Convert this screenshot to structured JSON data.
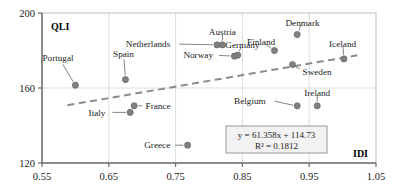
{
  "chart_data": {
    "type": "scatter",
    "title": "",
    "xlabel": "IDI",
    "ylabel": "QLI",
    "xlim": [
      0.55,
      1.05
    ],
    "ylim": [
      120,
      200
    ],
    "xticks": [
      "0.55",
      "0.65",
      "0.75",
      "0.85",
      "0.95",
      "1.05"
    ],
    "xtick_values": [
      0.55,
      0.65,
      0.75,
      0.85,
      0.95,
      1.05
    ],
    "yticks": [
      "120",
      "160",
      "200"
    ],
    "ytick_values": [
      120,
      160,
      200
    ],
    "grid": true,
    "legend": "none",
    "marker_color": "#808080",
    "trendline_color": "#8c8c8c",
    "points": [
      {
        "label": "Portugal",
        "x": 0.6,
        "y": 161.5,
        "lx": 0.574,
        "ly": 176.0,
        "anchor": "middle"
      },
      {
        "label": "Spain",
        "x": 0.675,
        "y": 164.5,
        "lx": 0.672,
        "ly": 178.5,
        "anchor": "middle"
      },
      {
        "label": "Italy",
        "x": 0.682,
        "y": 147.0,
        "lx": 0.645,
        "ly": 147.0,
        "anchor": "end"
      },
      {
        "label": "France",
        "x": 0.688,
        "y": 150.5,
        "lx": 0.705,
        "ly": 150.5,
        "anchor": "start"
      },
      {
        "label": "Greece",
        "x": 0.768,
        "y": 129.5,
        "lx": 0.742,
        "ly": 129.5,
        "anchor": "end"
      },
      {
        "label": "Netherlands",
        "x": 0.812,
        "y": 183.0,
        "lx": 0.742,
        "ly": 183.5,
        "anchor": "end"
      },
      {
        "label": "Austria",
        "x": 0.82,
        "y": 183.0,
        "lx": 0.82,
        "ly": 190.0,
        "anchor": "middle"
      },
      {
        "label": "Norway",
        "x": 0.838,
        "y": 177.0,
        "lx": 0.806,
        "ly": 177.5,
        "anchor": "end"
      },
      {
        "label": "Germany",
        "x": 0.843,
        "y": 177.5,
        "lx": 0.85,
        "ly": 183.0,
        "anchor": "middle"
      },
      {
        "label": "Finland",
        "x": 0.898,
        "y": 180.0,
        "lx": 0.878,
        "ly": 184.5,
        "anchor": "middle"
      },
      {
        "label": "Denmark",
        "x": 0.932,
        "y": 188.5,
        "lx": 0.94,
        "ly": 195.0,
        "anchor": "middle"
      },
      {
        "label": "Sweden",
        "x": 0.925,
        "y": 172.5,
        "lx": 0.94,
        "ly": 168.5,
        "anchor": "start"
      },
      {
        "label": "Belgium",
        "x": 0.932,
        "y": 150.5,
        "lx": 0.885,
        "ly": 153.0,
        "anchor": "end"
      },
      {
        "label": "Ireland",
        "x": 0.962,
        "y": 150.5,
        "lx": 0.962,
        "ly": 157.5,
        "anchor": "middle"
      },
      {
        "label": "Iceland",
        "x": 1.002,
        "y": 175.5,
        "lx": 1.0,
        "ly": 183.5,
        "anchor": "middle"
      }
    ],
    "trendline": {
      "slope": 61.358,
      "intercept": 114.73,
      "r_squared": 0.1812,
      "equation_text": "y = 61.358x + 114.73",
      "r2_text": "R² = 0.1812",
      "style": "dashed"
    }
  }
}
